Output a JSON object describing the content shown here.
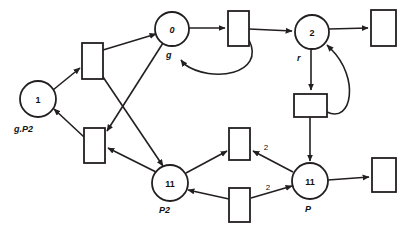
{
  "diagram": {
    "stroke_color": "#231f20",
    "background": "#ffffff",
    "places": [
      {
        "id": "p1",
        "tokens": "1",
        "label": "g.P2",
        "cx": 38,
        "cy": 99,
        "r": 18,
        "label_x": 14,
        "label_y": 124
      },
      {
        "id": "p0",
        "tokens": "0",
        "label": "g",
        "cx": 172,
        "cy": 29,
        "r": 17,
        "label_x": 166,
        "label_y": 50
      },
      {
        "id": "p2",
        "tokens": "2",
        "label": "r",
        "cx": 312,
        "cy": 32,
        "r": 17,
        "label_x": 297,
        "label_y": 53
      },
      {
        "id": "p11a",
        "tokens": "11",
        "label": "P2",
        "cx": 170,
        "cy": 183,
        "r": 18,
        "label_x": 159,
        "label_y": 205
      },
      {
        "id": "p11b",
        "tokens": "11",
        "label": "P",
        "cx": 310,
        "cy": 181,
        "r": 18,
        "label_x": 305,
        "label_y": 204
      }
    ],
    "transitions": [
      {
        "id": "t1",
        "x": 82,
        "y": 43,
        "w": 21,
        "h": 36
      },
      {
        "id": "t2",
        "x": 84,
        "y": 128,
        "w": 21,
        "h": 35
      },
      {
        "id": "t3",
        "x": 228,
        "y": 11,
        "w": 21,
        "h": 35
      },
      {
        "id": "t4",
        "x": 371,
        "y": 10,
        "w": 25,
        "h": 36
      },
      {
        "id": "t5",
        "x": 294,
        "y": 94,
        "w": 33,
        "h": 23
      },
      {
        "id": "t6",
        "x": 229,
        "y": 128,
        "w": 21,
        "h": 32
      },
      {
        "id": "t7",
        "x": 229,
        "y": 188,
        "w": 21,
        "h": 34
      },
      {
        "id": "t8",
        "x": 372,
        "y": 158,
        "w": 24,
        "h": 34
      }
    ],
    "arc_weights": [
      {
        "value": "2",
        "x": 266,
        "y": 150
      },
      {
        "value": "2",
        "x": 268,
        "y": 190
      }
    ]
  }
}
